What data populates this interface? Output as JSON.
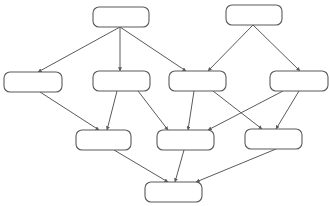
{
  "diagram": {
    "type": "directed-acyclic-graph",
    "stroke_color": "#5a5a5a",
    "background": "#ffffff",
    "nodes": [
      {
        "id": "A",
        "label": "",
        "x": 93,
        "y": 7,
        "w": 56,
        "h": 20
      },
      {
        "id": "B",
        "label": "",
        "x": 226,
        "y": 5,
        "w": 56,
        "h": 20
      },
      {
        "id": "C",
        "label": "",
        "x": 4,
        "y": 72,
        "w": 58,
        "h": 20
      },
      {
        "id": "D",
        "label": "",
        "x": 93,
        "y": 71,
        "w": 57,
        "h": 20
      },
      {
        "id": "E",
        "label": "",
        "x": 169,
        "y": 71,
        "w": 57,
        "h": 20
      },
      {
        "id": "F",
        "label": "",
        "x": 270,
        "y": 71,
        "w": 58,
        "h": 20
      },
      {
        "id": "G",
        "label": "",
        "x": 76,
        "y": 130,
        "w": 55,
        "h": 20
      },
      {
        "id": "H",
        "label": "",
        "x": 157,
        "y": 130,
        "w": 57,
        "h": 20
      },
      {
        "id": "I",
        "label": "",
        "x": 245,
        "y": 129,
        "w": 57,
        "h": 20
      },
      {
        "id": "J",
        "label": "",
        "x": 145,
        "y": 182,
        "w": 57,
        "h": 20
      }
    ],
    "edges": [
      {
        "from": "A",
        "to": "C",
        "x1": 120,
        "y1": 27,
        "x2": 38,
        "y2": 72
      },
      {
        "from": "A",
        "to": "D",
        "x1": 120,
        "y1": 27,
        "x2": 120,
        "y2": 71
      },
      {
        "from": "A",
        "to": "E",
        "x1": 120,
        "y1": 27,
        "x2": 186,
        "y2": 71
      },
      {
        "from": "B",
        "to": "E",
        "x1": 253,
        "y1": 25,
        "x2": 208,
        "y2": 71
      },
      {
        "from": "B",
        "to": "F",
        "x1": 253,
        "y1": 25,
        "x2": 300,
        "y2": 71
      },
      {
        "from": "C",
        "to": "G",
        "x1": 40,
        "y1": 92,
        "x2": 99,
        "y2": 130
      },
      {
        "from": "D",
        "to": "G",
        "x1": 117,
        "y1": 91,
        "x2": 107,
        "y2": 130
      },
      {
        "from": "D",
        "to": "H",
        "x1": 138,
        "y1": 91,
        "x2": 168,
        "y2": 130
      },
      {
        "from": "E",
        "to": "H",
        "x1": 194,
        "y1": 91,
        "x2": 188,
        "y2": 130
      },
      {
        "from": "E",
        "to": "I",
        "x1": 213,
        "y1": 91,
        "x2": 262,
        "y2": 129
      },
      {
        "from": "F",
        "to": "H",
        "x1": 283,
        "y1": 91,
        "x2": 208,
        "y2": 130
      },
      {
        "from": "F",
        "to": "I",
        "x1": 299,
        "y1": 91,
        "x2": 276,
        "y2": 129
      },
      {
        "from": "G",
        "to": "J",
        "x1": 114,
        "y1": 150,
        "x2": 168,
        "y2": 182
      },
      {
        "from": "H",
        "to": "J",
        "x1": 184,
        "y1": 150,
        "x2": 175,
        "y2": 182
      },
      {
        "from": "I",
        "to": "J",
        "x1": 276,
        "y1": 149,
        "x2": 196,
        "y2": 182
      }
    ]
  }
}
